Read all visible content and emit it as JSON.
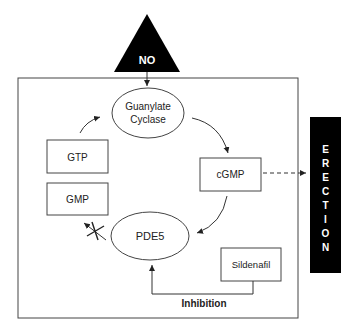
{
  "diagram": {
    "trigger": {
      "label": "NO",
      "shape": "triangle",
      "fill": "#000000",
      "text_color": "#ffffff"
    },
    "enzyme_top": {
      "line1": "Guanylate",
      "line2": "Cyclase",
      "shape": "ellipse"
    },
    "substrate": {
      "label": "GTP",
      "shape": "box"
    },
    "product": {
      "label": "cGMP",
      "shape": "box"
    },
    "metabolite": {
      "label": "GMP",
      "shape": "box"
    },
    "enzyme_bottom": {
      "label": "PDE5",
      "shape": "ellipse"
    },
    "drug": {
      "label": "Sildenafil",
      "shape": "box"
    },
    "inhibition": {
      "label": "Inhibition"
    },
    "outcome": {
      "letters": [
        "E",
        "R",
        "E",
        "C",
        "T",
        "I",
        "O",
        "N"
      ],
      "fill": "#000000",
      "text_color": "#ffffff"
    },
    "colors": {
      "line": "#333333",
      "background": "#ffffff"
    }
  }
}
